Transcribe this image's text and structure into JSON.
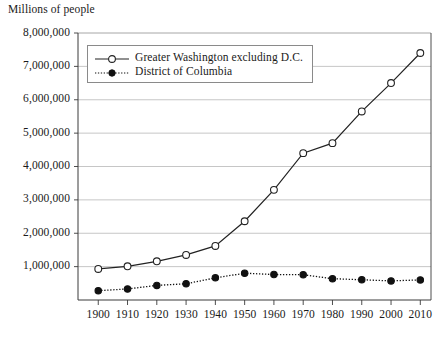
{
  "chart_data": {
    "type": "line",
    "title": "Millions of people",
    "subtitle": "",
    "xlabel": "",
    "ylabel": "Millions of people",
    "x": [
      1900,
      1910,
      1920,
      1930,
      1940,
      1950,
      1960,
      1970,
      1980,
      1990,
      2000,
      2010
    ],
    "categories": [
      "1900",
      "1910",
      "1920",
      "1930",
      "1940",
      "1950",
      "1960",
      "1970",
      "1980",
      "1990",
      "2000",
      "2010"
    ],
    "xlim": [
      1895,
      2015
    ],
    "ylim": [
      0,
      8000000
    ],
    "yticks": [
      1000000,
      2000000,
      3000000,
      4000000,
      5000000,
      6000000,
      7000000,
      8000000
    ],
    "ytick_labels": [
      "1,000,000",
      "2,000,000",
      "3,000,000",
      "4,000,000",
      "5,000,000",
      "6,000,000",
      "7,000,000",
      "8,000,000"
    ],
    "grid": true,
    "grid_axis": "y",
    "legend_position": "top-left-inside",
    "series": [
      {
        "name": "Greater Washington excluding D.C.",
        "marker": "open-circle",
        "line_style": "solid",
        "color": "#222222",
        "values": [
          930000,
          1010000,
          1160000,
          1350000,
          1620000,
          2360000,
          3300000,
          4400000,
          4700000,
          5650000,
          6500000,
          7400000
        ]
      },
      {
        "name": "District of Columbia",
        "marker": "filled-circle",
        "line_style": "dotted",
        "color": "#111111",
        "values": [
          279000,
          331000,
          438000,
          487000,
          663000,
          802000,
          764000,
          757000,
          638000,
          607000,
          572000,
          602000
        ]
      }
    ],
    "annotations": []
  },
  "legend": {
    "items": [
      {
        "label": "Greater Washington excluding D.C."
      },
      {
        "label": "District of Columbia"
      }
    ]
  },
  "colors": {
    "axis": "#3a3a3a",
    "grid": "#bfbfbf",
    "series_1": "#222222",
    "series_2": "#111111",
    "legend_border": "#8a8a8a",
    "background": "#ffffff"
  }
}
